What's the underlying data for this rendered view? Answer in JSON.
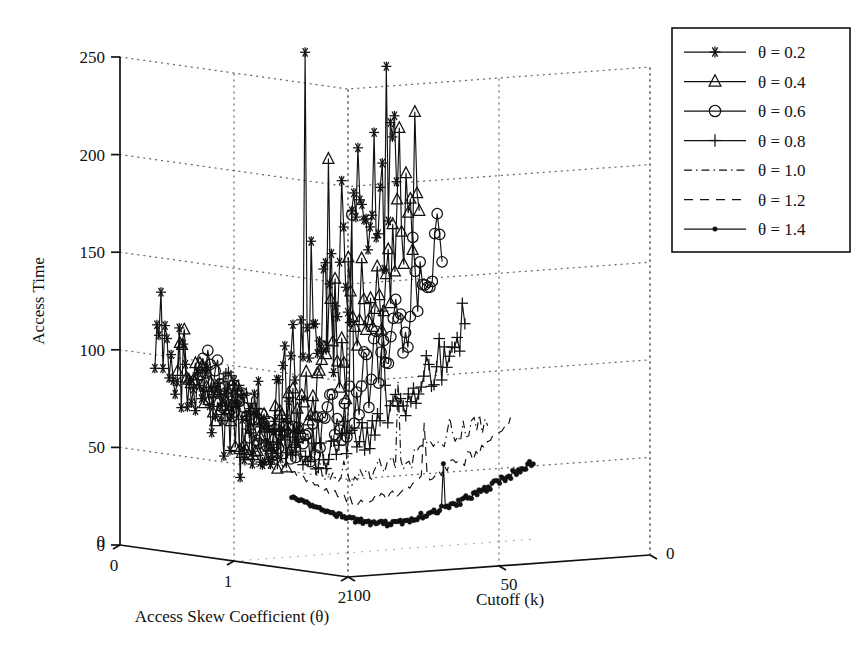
{
  "chart_data": {
    "type": "line",
    "render": "3d-surface-lines",
    "title": "",
    "xlabel": "Access Skew Coefficient (θ)",
    "zlabel": "Cutoff (k)",
    "ylabel": "Access Time",
    "ylim": [
      0,
      250
    ],
    "yticks": [
      0,
      50,
      100,
      150,
      200,
      250
    ],
    "xticks": [
      0,
      1,
      2
    ],
    "xtick_labels": [
      "0",
      "1",
      "2"
    ],
    "zticks": [
      100,
      50,
      0
    ],
    "ztick_labels": [
      "100",
      "50",
      "0"
    ],
    "zorigin_label": "0",
    "yorigin_label": "0",
    "grid": true,
    "grid_style": "dotted",
    "legend_position": "top-right",
    "series": [
      {
        "name": "θ = 0.2",
        "theta": 0.2,
        "marker": "asterisk",
        "line": "solid",
        "start": 105,
        "end": 195,
        "noise": 38,
        "spike": 56,
        "seed": 11,
        "npoints": 120,
        "peak": 250
      },
      {
        "name": "θ = 0.4",
        "theta": 0.4,
        "marker": "triangle",
        "line": "solid",
        "start": 101,
        "end": 175,
        "noise": 26,
        "spike": 34,
        "seed": 23,
        "npoints": 110,
        "peak": 195
      },
      {
        "name": "θ = 0.6",
        "theta": 0.6,
        "marker": "circle",
        "line": "solid",
        "start": 98,
        "end": 150,
        "noise": 19,
        "spike": 24,
        "seed": 37,
        "npoints": 100,
        "peak": 168
      },
      {
        "name": "θ = 0.8",
        "theta": 0.8,
        "marker": "plus",
        "line": "solid",
        "start": 95,
        "end": 108,
        "noise": 11,
        "spike": 14,
        "seed": 53,
        "npoints": 95,
        "peak": 120
      },
      {
        "name": "θ = 1.0",
        "theta": 1.0,
        "marker": "none",
        "line": "dashdot",
        "start": 78,
        "end": 64,
        "noise": 6,
        "spike": 7,
        "seed": 71,
        "npoints": 90,
        "peak": 86
      },
      {
        "name": "θ = 1.2",
        "theta": 1.2,
        "marker": "none",
        "line": "dashed",
        "start": 56,
        "end": 62,
        "noise": 4,
        "spike": 5,
        "seed": 89,
        "npoints": 85,
        "peak": 66
      },
      {
        "name": "θ = 1.4",
        "theta": 1.4,
        "marker": "dot",
        "line": "solid",
        "start": 36,
        "end": 45,
        "noise": 2,
        "spike": 2,
        "seed": 101,
        "npoints": 130,
        "peak": 47
      }
    ]
  },
  "axes": {
    "y_title": "Access Time",
    "x_title": "Access Skew Coefficient (θ)",
    "z_title": "Cutoff (k)",
    "y_ticks": [
      "250",
      "200",
      "150",
      "100",
      "50",
      "0"
    ],
    "x_ticks": [
      "0",
      "1",
      "2"
    ],
    "z_ticks": [
      "100",
      "50",
      "0"
    ]
  },
  "legend": {
    "items": [
      {
        "label": "θ = 0.2",
        "marker": "asterisk",
        "line": "solid"
      },
      {
        "label": "θ = 0.4",
        "marker": "triangle",
        "line": "solid"
      },
      {
        "label": "θ = 0.6",
        "marker": "circle",
        "line": "solid"
      },
      {
        "label": "θ = 0.8",
        "marker": "plus",
        "line": "solid"
      },
      {
        "label": "θ = 1.0",
        "marker": "none",
        "line": "dashdot"
      },
      {
        "label": "θ = 1.2",
        "marker": "none",
        "line": "dashed"
      },
      {
        "label": "θ = 1.4",
        "marker": "dot",
        "line": "solid"
      }
    ]
  },
  "colors": {
    "background": "#ffffff",
    "ink": "#111111",
    "grid": "#555555"
  }
}
